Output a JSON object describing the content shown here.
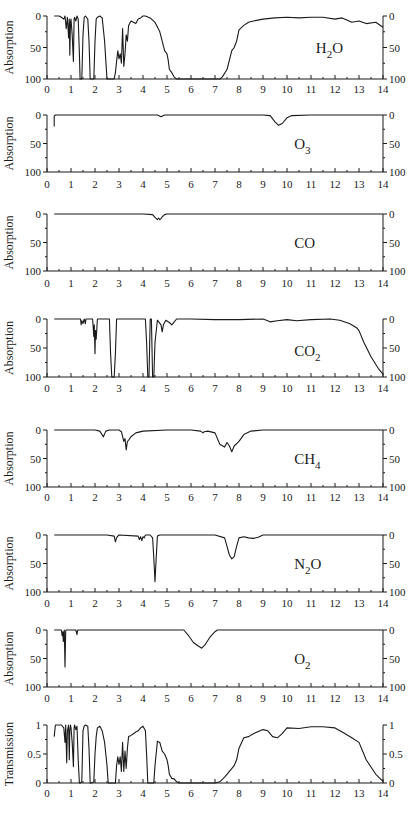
{
  "figure": {
    "x_axis": {
      "min": 0,
      "max": 14,
      "ticks": [
        0,
        1,
        2,
        3,
        4,
        5,
        6,
        7,
        8,
        9,
        10,
        11,
        12,
        13,
        14
      ],
      "minor_step": 0.5
    },
    "plot_left_px": 47,
    "plot_right_px": 383
  },
  "chart_data": [
    {
      "type": "line",
      "name": "H2O",
      "species_label": {
        "main": "H",
        "sub": "2",
        "tail": "O"
      },
      "ylabel": "Absorption",
      "y_ticks": [
        "0",
        "50",
        "100"
      ],
      "ylim": [
        0,
        100
      ],
      "y_inverted": true,
      "frame_px": {
        "top": 16,
        "bottom": 79,
        "label_y": 93
      },
      "species_pos": {
        "x": 11.2,
        "y": 50
      },
      "x": [
        0.3,
        0.5,
        0.6,
        0.7,
        0.75,
        0.8,
        0.85,
        0.9,
        0.93,
        0.95,
        0.98,
        1.0,
        1.05,
        1.1,
        1.13,
        1.15,
        1.2,
        1.25,
        1.3,
        1.35,
        1.38,
        1.4,
        1.45,
        1.5,
        1.55,
        1.6,
        1.7,
        1.75,
        1.8,
        1.85,
        1.9,
        1.95,
        2.0,
        2.05,
        2.1,
        2.2,
        2.3,
        2.4,
        2.45,
        2.5,
        2.55,
        2.6,
        2.7,
        2.8,
        2.85,
        2.9,
        2.95,
        3.0,
        3.05,
        3.1,
        3.15,
        3.2,
        3.25,
        3.3,
        3.35,
        3.4,
        3.5,
        3.6,
        3.7,
        3.8,
        3.9,
        4.0,
        4.1,
        4.3,
        4.5,
        4.7,
        4.8,
        4.9,
        5.0,
        5.05,
        5.1,
        5.2,
        5.3,
        5.4,
        5.5,
        6.0,
        7.0,
        7.2,
        7.3,
        7.5,
        7.6,
        7.7,
        7.8,
        7.9,
        8.0,
        8.2,
        8.4,
        8.6,
        9.0,
        9.5,
        10.0,
        10.5,
        11.0,
        11.5,
        12.0,
        12.3,
        12.7,
        13.0,
        13.3,
        13.7,
        14.0
      ],
      "values": [
        0,
        0,
        2,
        5,
        0,
        20,
        2,
        35,
        5,
        62,
        10,
        5,
        30,
        72,
        5,
        2,
        8,
        0,
        5,
        60,
        100,
        100,
        100,
        30,
        2,
        0,
        5,
        40,
        100,
        100,
        100,
        100,
        40,
        5,
        2,
        0,
        3,
        40,
        70,
        100,
        100,
        100,
        100,
        100,
        90,
        72,
        55,
        68,
        60,
        75,
        20,
        80,
        60,
        30,
        40,
        15,
        8,
        10,
        12,
        5,
        3,
        0,
        0,
        3,
        10,
        25,
        40,
        55,
        60,
        70,
        85,
        90,
        97,
        100,
        100,
        100,
        100,
        100,
        97,
        85,
        70,
        55,
        50,
        40,
        22,
        15,
        10,
        8,
        5,
        3,
        2,
        3,
        2,
        2,
        5,
        3,
        10,
        8,
        12,
        10,
        18
      ],
      "units": "Absorption (%)"
    },
    {
      "type": "line",
      "name": "O3",
      "species_label": {
        "main": "O",
        "sub": "3",
        "tail": ""
      },
      "ylabel": "Absorption",
      "y_ticks": [
        "0",
        "50",
        "100"
      ],
      "ylim": [
        0,
        100
      ],
      "y_inverted": true,
      "frame_px": {
        "top": 115,
        "bottom": 172,
        "label_y": 188
      },
      "species_pos": {
        "x": 10.3,
        "y": 50
      },
      "x": [
        0.3,
        0.3,
        0.35,
        1.0,
        2.0,
        3.0,
        4.0,
        4.6,
        4.75,
        4.9,
        5.5,
        7.0,
        8.0,
        9.0,
        9.3,
        9.5,
        9.65,
        9.8,
        10.0,
        10.2,
        11.0,
        12.0,
        13.0,
        14.0
      ],
      "values": [
        20,
        2,
        0,
        0,
        0,
        0,
        0,
        0,
        3,
        0,
        0,
        0,
        0,
        0,
        1,
        12,
        18,
        15,
        5,
        1,
        0,
        0,
        0,
        0
      ]
    },
    {
      "type": "line",
      "name": "CO",
      "species_label": {
        "main": "CO",
        "sub": "",
        "tail": ""
      },
      "ylabel": "Absorption",
      "y_ticks": [
        "0",
        "50",
        "100"
      ],
      "ylim": [
        0,
        100
      ],
      "y_inverted": true,
      "frame_px": {
        "top": 214,
        "bottom": 271,
        "label_y": 287
      },
      "species_pos": {
        "x": 10.3,
        "y": 50
      },
      "x": [
        0.3,
        1,
        2,
        3,
        4,
        4.4,
        4.5,
        4.6,
        4.65,
        4.7,
        4.75,
        4.8,
        4.9,
        5.0,
        6,
        7,
        8,
        9,
        10,
        11,
        12,
        13,
        14
      ],
      "values": [
        0,
        0,
        0,
        0,
        0,
        1,
        6,
        10,
        7,
        10,
        8,
        5,
        1,
        0,
        0,
        0,
        0,
        0,
        0,
        0,
        0,
        0,
        0
      ]
    },
    {
      "type": "line",
      "name": "CO2",
      "species_label": {
        "main": "CO",
        "sub": "2",
        "tail": ""
      },
      "ylabel": "Absorption",
      "y_ticks": [
        "0",
        "50",
        "100"
      ],
      "ylim": [
        0,
        100
      ],
      "y_inverted": true,
      "frame_px": {
        "top": 319,
        "bottom": 377,
        "label_y": 392
      },
      "species_pos": {
        "x": 10.3,
        "y": 55
      },
      "x": [
        0.3,
        1.4,
        1.42,
        1.45,
        1.5,
        1.55,
        1.6,
        1.62,
        1.9,
        1.95,
        1.97,
        2.0,
        2.02,
        2.05,
        2.1,
        2.6,
        2.65,
        2.7,
        2.75,
        2.8,
        2.85,
        2.9,
        4.1,
        4.15,
        4.2,
        4.25,
        4.3,
        4.35,
        4.4,
        4.45,
        4.5,
        4.6,
        4.75,
        4.8,
        4.85,
        4.95,
        5.1,
        5.2,
        5.3,
        5.4,
        6,
        7,
        8,
        9,
        9.2,
        9.3,
        9.6,
        10,
        10.4,
        11,
        11.8,
        12.2,
        12.6,
        12.9,
        13.0,
        13.2,
        13.5,
        13.8,
        14.0
      ],
      "values": [
        0,
        0,
        10,
        3,
        8,
        0,
        8,
        0,
        0,
        30,
        10,
        60,
        20,
        35,
        0,
        0,
        60,
        100,
        100,
        100,
        60,
        0,
        0,
        40,
        100,
        100,
        0,
        0,
        100,
        100,
        40,
        2,
        10,
        22,
        10,
        2,
        6,
        10,
        5,
        0,
        0,
        1,
        1,
        0,
        3,
        5,
        3,
        1,
        3,
        1,
        0,
        2,
        8,
        15,
        20,
        40,
        65,
        85,
        95
      ]
    },
    {
      "type": "line",
      "name": "CH4",
      "species_label": {
        "main": "CH",
        "sub": "4",
        "tail": ""
      },
      "ylabel": "Absorption",
      "y_ticks": [
        "0",
        "50",
        "100"
      ],
      "ylim": [
        0,
        100
      ],
      "y_inverted": true,
      "frame_px": {
        "top": 430,
        "bottom": 487,
        "label_y": 501
      },
      "species_pos": {
        "x": 10.3,
        "y": 50
      },
      "x": [
        0.3,
        2.0,
        2.2,
        2.35,
        2.45,
        2.6,
        3.0,
        3.1,
        3.2,
        3.25,
        3.3,
        3.35,
        3.4,
        3.5,
        3.7,
        4.0,
        5.0,
        6.0,
        6.4,
        6.5,
        6.55,
        6.7,
        7.0,
        7.2,
        7.4,
        7.5,
        7.6,
        7.7,
        7.8,
        8.0,
        8.2,
        8.5,
        9,
        10,
        11,
        12,
        13,
        14
      ],
      "values": [
        0,
        0,
        2,
        12,
        2,
        0,
        0,
        3,
        20,
        15,
        35,
        20,
        18,
        12,
        5,
        2,
        0,
        0,
        2,
        5,
        3,
        2,
        5,
        25,
        30,
        22,
        28,
        38,
        28,
        20,
        8,
        2,
        0,
        0,
        0,
        0,
        0,
        0
      ]
    },
    {
      "type": "line",
      "name": "N2O",
      "species_label": {
        "main": "N",
        "sub": "2",
        "tail": "O"
      },
      "ylabel": "Absorption",
      "y_ticks": [
        "0",
        "50",
        "100"
      ],
      "ylim": [
        0,
        100
      ],
      "y_inverted": true,
      "frame_px": {
        "top": 535,
        "bottom": 592,
        "label_y": 607
      },
      "species_pos": {
        "x": 10.3,
        "y": 50
      },
      "x": [
        0.3,
        2.5,
        2.8,
        2.85,
        2.9,
        2.95,
        3.0,
        3.8,
        3.85,
        3.9,
        3.95,
        4.0,
        4.05,
        4.1,
        4.3,
        4.4,
        4.45,
        4.5,
        4.55,
        4.6,
        4.7,
        5,
        6,
        7,
        7.4,
        7.5,
        7.6,
        7.7,
        7.8,
        7.9,
        8.0,
        8.2,
        8.4,
        8.6,
        8.8,
        9.0,
        10,
        11,
        12,
        13,
        14
      ],
      "values": [
        0,
        0,
        2,
        12,
        5,
        2,
        0,
        2,
        8,
        3,
        10,
        3,
        5,
        0,
        0,
        5,
        40,
        82,
        40,
        2,
        0,
        0,
        0,
        0,
        5,
        20,
        35,
        42,
        38,
        20,
        5,
        3,
        5,
        6,
        4,
        0,
        0,
        0,
        0,
        0,
        0
      ]
    },
    {
      "type": "line",
      "name": "O2",
      "species_label": {
        "main": "O",
        "sub": "2",
        "tail": ""
      },
      "ylabel": "Absorption",
      "y_ticks": [
        "0",
        "50",
        "100"
      ],
      "ylim": [
        0,
        100
      ],
      "y_inverted": true,
      "frame_px": {
        "top": 630,
        "bottom": 687,
        "label_y": 702
      },
      "species_pos": {
        "x": 10.3,
        "y": 50
      },
      "x": [
        0.3,
        0.6,
        0.63,
        0.66,
        0.68,
        0.7,
        0.72,
        0.75,
        0.78,
        0.8,
        1.2,
        1.25,
        1.27,
        1.3,
        5.7,
        5.9,
        6.1,
        6.3,
        6.45,
        6.6,
        6.8,
        7.0,
        7.1,
        8,
        9,
        10,
        11,
        12,
        13,
        14
      ],
      "values": [
        0,
        0,
        10,
        3,
        20,
        5,
        0,
        65,
        2,
        0,
        0,
        8,
        1,
        0,
        0,
        10,
        22,
        28,
        32,
        25,
        12,
        3,
        0,
        0,
        0,
        0,
        0,
        0,
        0,
        0
      ]
    },
    {
      "type": "line",
      "name": "Transmission",
      "species_label": {
        "main": "",
        "sub": "",
        "tail": ""
      },
      "ylabel": "Transmission",
      "y_ticks": [
        "1",
        "0.5",
        "0"
      ],
      "ylim": [
        0,
        1
      ],
      "y_inverted": false,
      "frame_px": {
        "top": 725,
        "bottom": 783,
        "label_y": 797
      },
      "species_pos": {
        "x": 0,
        "y": 0
      },
      "x": [
        0.3,
        0.3,
        0.35,
        0.5,
        0.6,
        0.7,
        0.75,
        0.78,
        0.82,
        0.85,
        0.9,
        0.93,
        0.95,
        0.98,
        1.0,
        1.05,
        1.1,
        1.13,
        1.15,
        1.2,
        1.25,
        1.3,
        1.35,
        1.38,
        1.45,
        1.5,
        1.55,
        1.6,
        1.7,
        1.75,
        1.8,
        1.85,
        1.95,
        2.0,
        2.05,
        2.1,
        2.2,
        2.3,
        2.4,
        2.45,
        2.5,
        2.55,
        2.85,
        2.9,
        2.95,
        3.0,
        3.05,
        3.1,
        3.15,
        3.2,
        3.25,
        3.3,
        3.35,
        3.4,
        3.5,
        3.6,
        3.7,
        3.8,
        3.9,
        4.0,
        4.1,
        4.15,
        4.2,
        4.45,
        4.5,
        4.6,
        4.7,
        4.8,
        4.9,
        5.0,
        5.05,
        5.1,
        5.2,
        5.3,
        5.4,
        5.5,
        6,
        7,
        7.2,
        7.4,
        7.6,
        7.8,
        7.9,
        8.0,
        8.2,
        8.4,
        8.6,
        9.0,
        9.2,
        9.4,
        9.6,
        9.8,
        10.0,
        10.5,
        11.0,
        11.5,
        12.0,
        12.3,
        12.7,
        13.0,
        13.3,
        13.7,
        14.0
      ],
      "values": [
        0.8,
        0.8,
        1,
        1,
        1,
        0.95,
        0.7,
        1,
        0.35,
        0.9,
        1,
        0.4,
        0.9,
        1,
        0.95,
        0.7,
        0.28,
        0.95,
        1,
        0.92,
        0.98,
        0.4,
        0,
        0,
        0.02,
        0.9,
        0.98,
        1,
        0.98,
        0.6,
        0,
        0,
        0.02,
        0.5,
        0.8,
        0.95,
        0.98,
        0.9,
        0.7,
        0.5,
        0.3,
        0,
        0,
        0.3,
        0.45,
        0.32,
        0.45,
        0.2,
        0.7,
        0.2,
        0.55,
        0.25,
        0.6,
        0.8,
        0.82,
        0.85,
        0.88,
        0.9,
        0.95,
        0.98,
        0.9,
        0.5,
        0,
        0,
        0.3,
        0.72,
        0.7,
        0.55,
        0.5,
        0.4,
        0.3,
        0.15,
        0.08,
        0.07,
        0.02,
        0,
        0,
        0,
        0.02,
        0.1,
        0.2,
        0.3,
        0.4,
        0.6,
        0.78,
        0.8,
        0.85,
        0.92,
        0.9,
        0.8,
        0.78,
        0.85,
        0.95,
        0.94,
        0.97,
        0.97,
        0.95,
        0.88,
        0.78,
        0.7,
        0.4,
        0.15,
        0.03
      ]
    }
  ]
}
